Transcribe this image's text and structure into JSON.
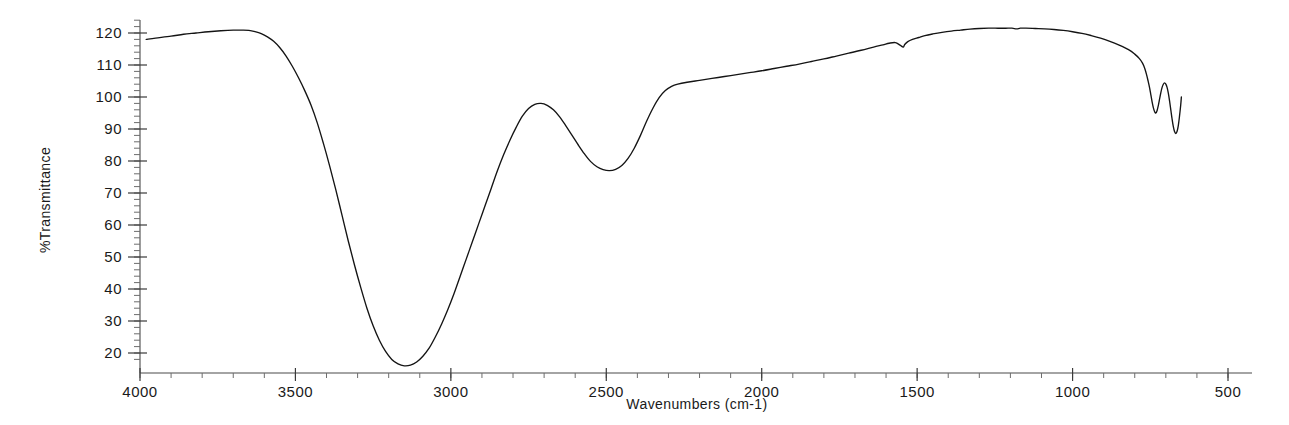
{
  "chart_data": {
    "type": "line",
    "title": "",
    "xlabel": "Wavenumbers (cm-1)",
    "ylabel": "%Transmittance",
    "xlim": [
      4000,
      500
    ],
    "ylim": [
      14,
      124
    ],
    "x_ticks": [
      4000,
      3500,
      3000,
      2500,
      2000,
      1500,
      1000,
      500
    ],
    "x_tick_labels": [
      "4000",
      "3500",
      "3000",
      "2500",
      "2000",
      "1500",
      "1000",
      "500"
    ],
    "y_ticks": [
      20,
      30,
      40,
      50,
      60,
      70,
      80,
      90,
      100,
      110,
      120
    ],
    "y_tick_labels": [
      "20",
      "30",
      "40",
      "50",
      "60",
      "70",
      "80",
      "90",
      "100",
      "110",
      "120"
    ],
    "x_minor_tick_step": 100,
    "y_minor_tick_step": 2,
    "grid": false,
    "legend": "none",
    "x_axis_reversed": true,
    "series": [
      {
        "name": "IR transmittance spectrum",
        "color": "#141414",
        "x_start": 3980,
        "x_end": 650,
        "points": [
          [
            3980,
            118.0
          ],
          [
            3950,
            118.4
          ],
          [
            3900,
            119.0
          ],
          [
            3860,
            119.6
          ],
          [
            3820,
            120.0
          ],
          [
            3780,
            120.4
          ],
          [
            3740,
            120.7
          ],
          [
            3700,
            120.9
          ],
          [
            3670,
            120.9
          ],
          [
            3650,
            120.8
          ],
          [
            3630,
            120.4
          ],
          [
            3610,
            119.8
          ],
          [
            3590,
            118.8
          ],
          [
            3570,
            117.4
          ],
          [
            3550,
            115.4
          ],
          [
            3530,
            112.8
          ],
          [
            3510,
            109.6
          ],
          [
            3490,
            106.0
          ],
          [
            3470,
            102.0
          ],
          [
            3450,
            97.5
          ],
          [
            3430,
            92.0
          ],
          [
            3410,
            85.5
          ],
          [
            3390,
            78.5
          ],
          [
            3370,
            71.0
          ],
          [
            3350,
            63.0
          ],
          [
            3330,
            55.0
          ],
          [
            3310,
            47.5
          ],
          [
            3290,
            40.5
          ],
          [
            3270,
            34.0
          ],
          [
            3250,
            28.5
          ],
          [
            3230,
            24.0
          ],
          [
            3210,
            20.5
          ],
          [
            3190,
            18.0
          ],
          [
            3170,
            16.6
          ],
          [
            3150,
            16.0
          ],
          [
            3130,
            16.2
          ],
          [
            3110,
            17.2
          ],
          [
            3090,
            19.0
          ],
          [
            3070,
            21.5
          ],
          [
            3050,
            25.0
          ],
          [
            3030,
            29.0
          ],
          [
            3010,
            33.5
          ],
          [
            2990,
            38.5
          ],
          [
            2970,
            44.0
          ],
          [
            2950,
            49.5
          ],
          [
            2930,
            55.0
          ],
          [
            2910,
            60.5
          ],
          [
            2890,
            66.0
          ],
          [
            2870,
            71.5
          ],
          [
            2850,
            77.0
          ],
          [
            2830,
            82.0
          ],
          [
            2810,
            86.5
          ],
          [
            2790,
            90.5
          ],
          [
            2770,
            94.0
          ],
          [
            2750,
            96.4
          ],
          [
            2730,
            97.7
          ],
          [
            2710,
            98.0
          ],
          [
            2690,
            97.4
          ],
          [
            2670,
            96.0
          ],
          [
            2650,
            93.8
          ],
          [
            2630,
            91.0
          ],
          [
            2610,
            88.0
          ],
          [
            2590,
            85.0
          ],
          [
            2570,
            82.2
          ],
          [
            2550,
            79.8
          ],
          [
            2530,
            78.2
          ],
          [
            2510,
            77.3
          ],
          [
            2490,
            77.0
          ],
          [
            2470,
            77.4
          ],
          [
            2450,
            78.6
          ],
          [
            2430,
            80.8
          ],
          [
            2410,
            84.0
          ],
          [
            2390,
            88.0
          ],
          [
            2370,
            92.5
          ],
          [
            2350,
            96.5
          ],
          [
            2330,
            99.8
          ],
          [
            2310,
            102.0
          ],
          [
            2290,
            103.3
          ],
          [
            2270,
            104.0
          ],
          [
            2240,
            104.6
          ],
          [
            2200,
            105.2
          ],
          [
            2160,
            105.8
          ],
          [
            2120,
            106.4
          ],
          [
            2080,
            107.0
          ],
          [
            2040,
            107.6
          ],
          [
            2000,
            108.2
          ],
          [
            1960,
            108.9
          ],
          [
            1920,
            109.6
          ],
          [
            1880,
            110.3
          ],
          [
            1840,
            111.1
          ],
          [
            1800,
            111.9
          ],
          [
            1760,
            112.8
          ],
          [
            1720,
            113.7
          ],
          [
            1680,
            114.6
          ],
          [
            1640,
            115.6
          ],
          [
            1610,
            116.3
          ],
          [
            1590,
            116.8
          ],
          [
            1570,
            117.0
          ],
          [
            1555,
            116.2
          ],
          [
            1545,
            115.6
          ],
          [
            1540,
            116.4
          ],
          [
            1530,
            117.3
          ],
          [
            1515,
            118.0
          ],
          [
            1495,
            118.6
          ],
          [
            1475,
            119.2
          ],
          [
            1450,
            119.7
          ],
          [
            1420,
            120.2
          ],
          [
            1390,
            120.6
          ],
          [
            1360,
            120.9
          ],
          [
            1330,
            121.2
          ],
          [
            1300,
            121.4
          ],
          [
            1270,
            121.5
          ],
          [
            1240,
            121.5
          ],
          [
            1215,
            121.5
          ],
          [
            1195,
            121.5
          ],
          [
            1180,
            121.3
          ],
          [
            1168,
            121.5
          ],
          [
            1150,
            121.5
          ],
          [
            1120,
            121.4
          ],
          [
            1090,
            121.3
          ],
          [
            1060,
            121.1
          ],
          [
            1030,
            120.8
          ],
          [
            1000,
            120.4
          ],
          [
            970,
            119.9
          ],
          [
            940,
            119.2
          ],
          [
            910,
            118.4
          ],
          [
            880,
            117.4
          ],
          [
            850,
            116.2
          ],
          [
            820,
            114.8
          ],
          [
            800,
            113.4
          ],
          [
            785,
            112.0
          ],
          [
            775,
            110.6
          ],
          [
            768,
            109.0
          ],
          [
            762,
            107.0
          ],
          [
            757,
            105.0
          ],
          [
            752,
            102.8
          ],
          [
            748,
            100.6
          ],
          [
            744,
            98.4
          ],
          [
            740,
            96.6
          ],
          [
            736,
            95.4
          ],
          [
            732,
            95.0
          ],
          [
            728,
            95.8
          ],
          [
            724,
            97.4
          ],
          [
            720,
            99.4
          ],
          [
            716,
            101.4
          ],
          [
            712,
            103.0
          ],
          [
            708,
            104.0
          ],
          [
            704,
            104.4
          ],
          [
            700,
            104.0
          ],
          [
            696,
            103.0
          ],
          [
            692,
            101.2
          ],
          [
            688,
            98.8
          ],
          [
            684,
            96.0
          ],
          [
            680,
            93.2
          ],
          [
            676,
            90.8
          ],
          [
            672,
            89.2
          ],
          [
            668,
            88.6
          ],
          [
            664,
            89.2
          ],
          [
            660,
            91.0
          ],
          [
            656,
            94.0
          ],
          [
            652,
            97.6
          ],
          [
            650,
            100.0
          ]
        ]
      }
    ],
    "annotations": [
      {
        "label": "broad O-H stretch minimum",
        "x": 3370,
        "y": 16
      },
      {
        "label": "C-H stretch",
        "x": 2920,
        "y": 77
      },
      {
        "label": "CO2 notch",
        "x": 2350,
        "y": 116
      },
      {
        "label": "C=O region",
        "x": 1730,
        "y": 97
      },
      {
        "label": "band near 1650",
        "x": 1650,
        "y": 87
      },
      {
        "label": "band near 1500",
        "x": 1500,
        "y": 115
      },
      {
        "label": "strong C-O band minimum",
        "x": 1030,
        "y": 15
      },
      {
        "label": "shoulder near 1160",
        "x": 1160,
        "y": 45
      },
      {
        "label": "band near 950",
        "x": 950,
        "y": 107
      },
      {
        "label": "band near 850",
        "x": 850,
        "y": 107
      },
      {
        "label": "spectrum end",
        "x": 650,
        "y": 82
      }
    ]
  },
  "axes": {
    "y_axis_title": "%Transmittance",
    "x_axis_title": "Wavenumbers (cm-1)"
  }
}
